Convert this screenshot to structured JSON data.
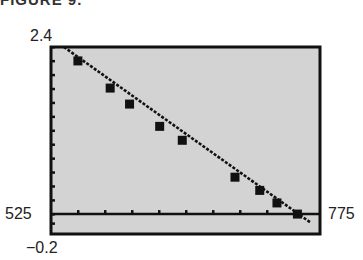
{
  "figure": {
    "title": "FIGURE 9. "
  },
  "window": {
    "xmin_label": "525",
    "xmax_label": "775",
    "ymin_label": "−0.2",
    "ymax_label": "2.4"
  },
  "colors": {
    "screen_bg": "#d3d3d3",
    "frame": "#111111",
    "ink": "#111111"
  },
  "chart_data": {
    "type": "scatter",
    "title": "",
    "xlabel": "",
    "ylabel": "",
    "xlim": [
      525,
      775
    ],
    "ylim": [
      -0.2,
      2.4
    ],
    "grid": false,
    "legend": "none",
    "x_tick_spacing_px": 27,
    "series": [
      {
        "name": "data points",
        "marker": "square",
        "x": [
          550,
          580,
          598,
          626,
          647,
          696,
          719,
          735,
          754
        ],
        "y": [
          2.2,
          1.81,
          1.58,
          1.26,
          1.06,
          0.53,
          0.34,
          0.16,
          0.0
        ]
      },
      {
        "name": "regression line",
        "marker": "none",
        "style": "dotted-pixel",
        "x": [
          537,
          766
        ],
        "y": [
          2.4,
          -0.12
        ]
      }
    ],
    "annotations": [
      "525",
      "775",
      "2.4",
      "−0.2"
    ]
  }
}
